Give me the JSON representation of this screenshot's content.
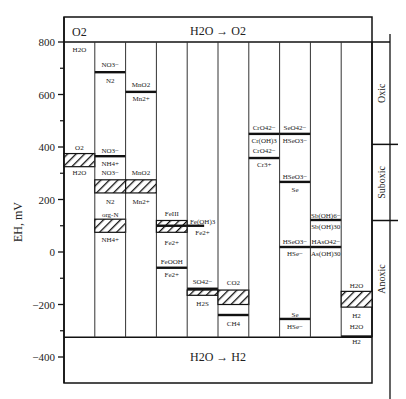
{
  "diagram": {
    "title_top_left": "O2",
    "title_top_center": "H2O → O2",
    "title_bottom_center": "H2O → H2",
    "y_axis_label": "EH, mV",
    "y_ticks": [
      800,
      600,
      400,
      200,
      0,
      -200,
      -400
    ],
    "y_minor_ticks": [
      700,
      500,
      300,
      100,
      -100,
      -300
    ],
    "zones": [
      {
        "label": "Oxic",
        "from": 800,
        "to": 410
      },
      {
        "label": "Suboxic",
        "from": 410,
        "to": 120
      },
      {
        "label": "Anoxic",
        "from": 120,
        "to": -325
      }
    ],
    "columns": [
      {
        "name": "oxygen",
        "lines": [],
        "hatches": [
          {
            "top": 375,
            "bottom": 325
          }
        ],
        "labels": [
          {
            "text": "H2O",
            "mv": 775
          },
          {
            "text": "O2",
            "mv": 400
          },
          {
            "text": "H2O",
            "mv": 305
          }
        ]
      },
      {
        "name": "nitrogen",
        "lines": [
          {
            "mv": 685
          },
          {
            "mv": 365
          }
        ],
        "hatches": [
          {
            "top": 275,
            "bottom": 225
          },
          {
            "top": 125,
            "bottom": 75
          }
        ],
        "labels": [
          {
            "text": "NO3−",
            "mv": 715
          },
          {
            "text": "N2",
            "mv": 655
          },
          {
            "text": "NO3−",
            "mv": 390
          },
          {
            "text": "NH4+",
            "mv": 340
          },
          {
            "text": "NO3−",
            "mv": 305
          },
          {
            "text": "N2",
            "mv": 195
          },
          {
            "text": "org-N",
            "mv": 145
          },
          {
            "text": "NH4+",
            "mv": 50
          }
        ]
      },
      {
        "name": "manganese",
        "lines": [
          {
            "mv": 610
          }
        ],
        "hatches": [
          {
            "top": 275,
            "bottom": 225
          }
        ],
        "labels": [
          {
            "text": "MnO2",
            "mv": 640
          },
          {
            "text": "Mn2+",
            "mv": 585
          },
          {
            "text": "MnO2",
            "mv": 305
          },
          {
            "text": "Mn2+",
            "mv": 195
          }
        ]
      },
      {
        "name": "iron",
        "lines": [
          {
            "mv": 100
          },
          {
            "mv": -60
          }
        ],
        "hatches": [
          {
            "top": 120,
            "bottom": 75
          }
        ],
        "labels": [
          {
            "text": "FeIII",
            "mv": 150
          },
          {
            "text": "Fe2+",
            "mv": 40
          },
          {
            "text": "FeOOH",
            "mv": -35
          },
          {
            "text": "Fe2+",
            "mv": -85
          }
        ]
      },
      {
        "name": "iron-hydroxide-sulfate",
        "lines": [
          {
            "mv": 100,
            "partial": true
          },
          {
            "mv": -140
          }
        ],
        "hatches": [
          {
            "top": -145,
            "bottom": -165
          }
        ],
        "labels": [
          {
            "text": "Fe(OH)3",
            "mv": 120
          },
          {
            "text": "Fe2+",
            "mv": 75
          },
          {
            "text": "SO42−",
            "mv": -110
          },
          {
            "text": "H2S",
            "mv": -195
          }
        ]
      },
      {
        "name": "carbon",
        "lines": [
          {
            "mv": -240
          }
        ],
        "hatches": [
          {
            "top": -145,
            "bottom": -200
          }
        ],
        "labels": [
          {
            "text": "CO2",
            "mv": -115
          },
          {
            "text": "CH4",
            "mv": -270
          }
        ]
      },
      {
        "name": "chromium",
        "lines": [
          {
            "mv": 450
          },
          {
            "mv": 358
          }
        ],
        "hatches": [],
        "labels": [
          {
            "text": "CrO42−",
            "mv": 475
          },
          {
            "text": "Cr(OH)3",
            "mv": 428
          },
          {
            "text": "CrO42−",
            "mv": 388
          },
          {
            "text": "Cr3+",
            "mv": 335
          }
        ]
      },
      {
        "name": "selenium",
        "lines": [
          {
            "mv": 450
          },
          {
            "mv": 267
          },
          {
            "mv": 19
          },
          {
            "mv": -255
          }
        ],
        "hatches": [],
        "labels": [
          {
            "text": "SeO42−",
            "mv": 475
          },
          {
            "text": "HSeO3−",
            "mv": 425
          },
          {
            "text": "HSeO3−",
            "mv": 290
          },
          {
            "text": "Se",
            "mv": 240
          },
          {
            "text": "HSeO3−",
            "mv": 42
          },
          {
            "text": "HSe−",
            "mv": -5
          },
          {
            "text": "Se",
            "mv": -235
          },
          {
            "text": "HSe−",
            "mv": -280
          }
        ]
      },
      {
        "name": "antimony-arsenic",
        "lines": [
          {
            "mv": 122
          },
          {
            "mv": 19
          }
        ],
        "hatches": [],
        "labels": [
          {
            "text": "Sb(OH)6−",
            "mv": 142
          },
          {
            "text": "Sb(OH)30",
            "mv": 98
          },
          {
            "text": "HAsO42−",
            "mv": 42
          },
          {
            "text": "As(OH)30",
            "mv": -5
          }
        ]
      },
      {
        "name": "hydrogen",
        "lines": [
          {
            "mv": -322
          }
        ],
        "hatches": [
          {
            "top": -150,
            "bottom": -210
          }
        ],
        "labels": [
          {
            "text": "H2O",
            "mv": -125
          },
          {
            "text": "H2",
            "mv": -240
          },
          {
            "text": "H2O",
            "mv": -280
          },
          {
            "text": "H2",
            "mv": -340
          }
        ]
      }
    ]
  }
}
